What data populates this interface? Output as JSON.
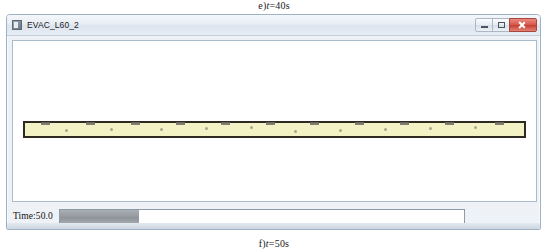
{
  "figure": {
    "caption_top_prefix": "e)",
    "caption_top_var": "t",
    "caption_top_value": "=40s",
    "caption_bottom_prefix": "f)",
    "caption_bottom_var": "t",
    "caption_bottom_value": "=50s"
  },
  "window": {
    "title": "EVAC_L60_2",
    "icon": "app-icon",
    "controls": {
      "minimize_label": "Minimize",
      "maximize_label": "Maximize",
      "close_label": "Close"
    }
  },
  "simulation": {
    "corridor_fill_color": "#f2f2c4",
    "corridor_border_color": "#2e2a21",
    "exit_marks_count": 11,
    "exit_marks_positions_pct": [
      4,
      13,
      22,
      31,
      40,
      49,
      58,
      67,
      76,
      85,
      95
    ],
    "agents_positions_pct": [
      8,
      17,
      27,
      36,
      45,
      54,
      63,
      72,
      81,
      90
    ]
  },
  "status": {
    "time_label": "Time:50.0",
    "progress_percent": 19.5,
    "progress_fill_color": "#9a9fa5"
  }
}
